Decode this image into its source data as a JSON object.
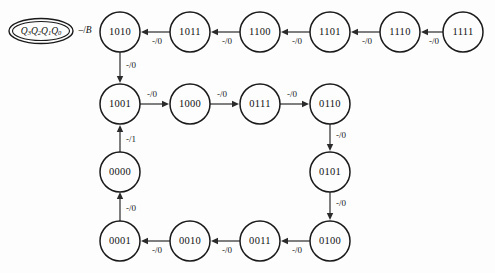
{
  "diagram": {
    "type": "state-transition-diagram",
    "legend": {
      "state_encoding_prefix": "Q",
      "state_encoding_subscripts": [
        "3",
        "2",
        "1",
        "0"
      ],
      "state_encoding_full": "Q3Q2Q1Q0",
      "output_label": "-/B",
      "output_label_input": "-",
      "output_label_separator": "/",
      "output_label_output": "B"
    },
    "states": [
      {
        "id": "s1010",
        "label": "1010",
        "cx": 120,
        "cy": 32
      },
      {
        "id": "s1011",
        "label": "1011",
        "cx": 190,
        "cy": 32
      },
      {
        "id": "s1100",
        "label": "1100",
        "cx": 260,
        "cy": 32
      },
      {
        "id": "s1101",
        "label": "1101",
        "cx": 330,
        "cy": 32
      },
      {
        "id": "s1110",
        "label": "1110",
        "cx": 400,
        "cy": 32
      },
      {
        "id": "s1111",
        "label": "1111",
        "cx": 463,
        "cy": 32
      },
      {
        "id": "s1001",
        "label": "1001",
        "cx": 120,
        "cy": 104
      },
      {
        "id": "s1000",
        "label": "1000",
        "cx": 190,
        "cy": 104
      },
      {
        "id": "s0111",
        "label": "0111",
        "cx": 260,
        "cy": 104
      },
      {
        "id": "s0110",
        "label": "0110",
        "cx": 330,
        "cy": 104
      },
      {
        "id": "s0000",
        "label": "0000",
        "cx": 120,
        "cy": 172
      },
      {
        "id": "s0101",
        "label": "0101",
        "cx": 330,
        "cy": 172
      },
      {
        "id": "s0001",
        "label": "0001",
        "cx": 120,
        "cy": 241
      },
      {
        "id": "s0010",
        "label": "0010",
        "cx": 190,
        "cy": 241
      },
      {
        "id": "s0011",
        "label": "0011",
        "cx": 260,
        "cy": 241
      },
      {
        "id": "s0100",
        "label": "0100",
        "cx": 330,
        "cy": 241
      }
    ],
    "transitions": [
      {
        "from": "1011",
        "to": "1010",
        "label": "-/0",
        "input": "-",
        "output": "0",
        "direction": "left"
      },
      {
        "from": "1100",
        "to": "1011",
        "label": "-/0",
        "input": "-",
        "output": "0",
        "direction": "left"
      },
      {
        "from": "1101",
        "to": "1100",
        "label": "-/0",
        "input": "-",
        "output": "0",
        "direction": "left"
      },
      {
        "from": "1110",
        "to": "1101",
        "label": "-/0",
        "input": "-",
        "output": "0",
        "direction": "left"
      },
      {
        "from": "1111",
        "to": "1110",
        "label": "-/0",
        "input": "-",
        "output": "0",
        "direction": "left"
      },
      {
        "from": "1010",
        "to": "1001",
        "label": "-/0",
        "input": "-",
        "output": "0",
        "direction": "down"
      },
      {
        "from": "1001",
        "to": "1000",
        "label": "-/0",
        "input": "-",
        "output": "0",
        "direction": "right"
      },
      {
        "from": "1000",
        "to": "0111",
        "label": "-/0",
        "input": "-",
        "output": "0",
        "direction": "right"
      },
      {
        "from": "0111",
        "to": "0110",
        "label": "-/0",
        "input": "-",
        "output": "0",
        "direction": "right"
      },
      {
        "from": "0110",
        "to": "0101",
        "label": "-/0",
        "input": "-",
        "output": "0",
        "direction": "down"
      },
      {
        "from": "0101",
        "to": "0100",
        "label": "-/0",
        "input": "-",
        "output": "0",
        "direction": "down"
      },
      {
        "from": "0100",
        "to": "0011",
        "label": "-/0",
        "input": "-",
        "output": "0",
        "direction": "left"
      },
      {
        "from": "0011",
        "to": "0010",
        "label": "-/0",
        "input": "-",
        "output": "0",
        "direction": "left"
      },
      {
        "from": "0010",
        "to": "0001",
        "label": "-/0",
        "input": "-",
        "output": "0",
        "direction": "left"
      },
      {
        "from": "0001",
        "to": "0000",
        "label": "-/0",
        "input": "-",
        "output": "0",
        "direction": "up"
      },
      {
        "from": "0000",
        "to": "1001",
        "label": "-/1",
        "input": "-",
        "output": "1",
        "direction": "up"
      }
    ],
    "colors": {
      "background": "#fdfdfd",
      "stroke": "#1a1a1a",
      "edge": "#2b2b2b",
      "text": "#111111"
    }
  }
}
